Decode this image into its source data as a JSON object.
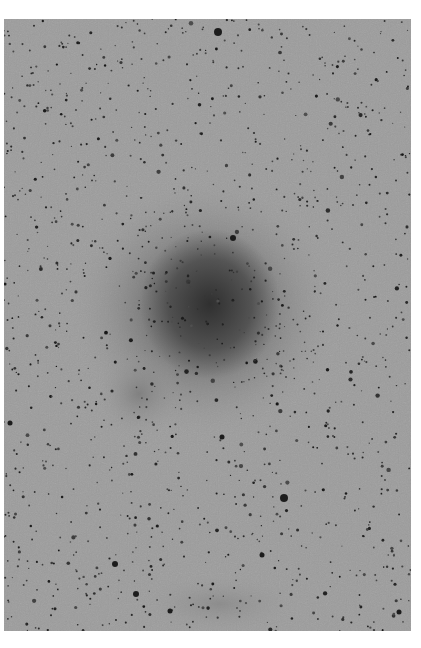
{
  "image": {
    "description": "Inverted (negative) astronomical photographic plate showing a dense star field with a diffuse dark nebulous glow near center",
    "canvas": {
      "width": 421,
      "height": 648,
      "background": "#ffffff"
    },
    "plate": {
      "x": 4,
      "y": 19,
      "width": 407,
      "height": 612,
      "base_color": "#9c9c9c"
    },
    "colors": {
      "background_gray": "#9c9c9c",
      "core_dark": "#3a3a3a",
      "halo_gray": "#707070",
      "star_dark": "#1e1e1e"
    },
    "nebula": {
      "core": {
        "cx": 206,
        "cy": 285,
        "rx": 70,
        "ry": 75
      },
      "halo": {
        "cx": 200,
        "cy": 290,
        "rx": 135,
        "ry": 130
      },
      "lobe": {
        "cx": 135,
        "cy": 375,
        "rx": 45,
        "ry": 45
      },
      "bottom_glow": {
        "cx": 215,
        "cy": 585,
        "rx": 80,
        "ry": 30
      }
    },
    "bright_stars": [
      {
        "x": 214,
        "y": 13,
        "r": 4
      },
      {
        "x": 280,
        "y": 479,
        "r": 4
      },
      {
        "x": 111,
        "y": 545,
        "r": 3
      },
      {
        "x": 132,
        "y": 575,
        "r": 3
      },
      {
        "x": 229,
        "y": 219,
        "r": 3
      },
      {
        "x": 218,
        "y": 418,
        "r": 2.5
      },
      {
        "x": 258,
        "y": 536,
        "r": 2.5
      },
      {
        "x": 6,
        "y": 404,
        "r": 2.5
      },
      {
        "x": 166,
        "y": 592,
        "r": 2.5
      },
      {
        "x": 395,
        "y": 593,
        "r": 2.5
      }
    ],
    "starfield": {
      "count": 1400,
      "seed": 7
    }
  }
}
